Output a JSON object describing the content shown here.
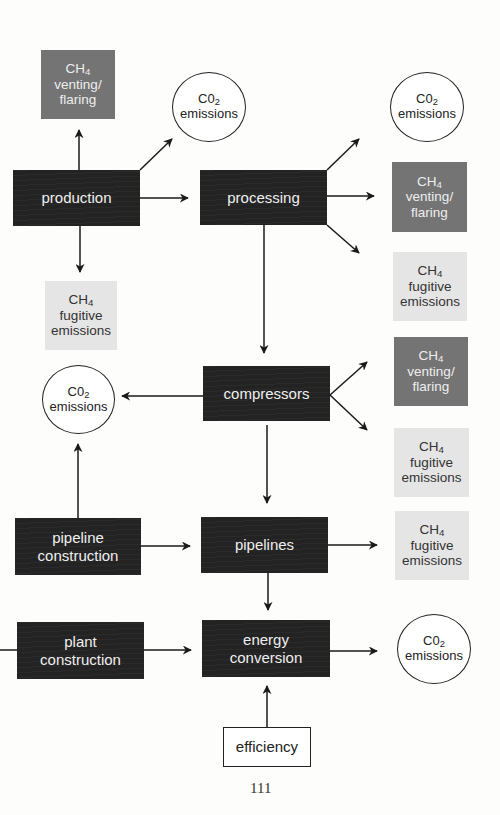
{
  "diagram": {
    "type": "flowchart",
    "page_number": "111",
    "colors": {
      "process_box": "#232323",
      "venting_box": "#747474",
      "fugitive_box": "#e5e5e5",
      "arrow": "#1a1a1a"
    },
    "labels": {
      "ch4": "CH",
      "ch4_sub": "4",
      "co2": "C0",
      "co2_sub": "2",
      "emissions": "emissions",
      "venting": "venting/",
      "flaring": "flaring",
      "fugitive": "fugitive"
    },
    "process_nodes": {
      "production": "production",
      "processing": "processing",
      "compressors": "compressors",
      "pipeline_construction_1": "pipeline",
      "pipeline_construction_2": "construction",
      "pipelines": "pipelines",
      "plant_construction_1": "plant",
      "plant_construction_2": "construction",
      "energy_conversion_1": "energy",
      "energy_conversion_2": "conversion",
      "efficiency": "efficiency"
    },
    "edges": [
      {
        "from": "production",
        "to": "CH4 venting/flaring (top)"
      },
      {
        "from": "production",
        "to": "C02 emissions (top)"
      },
      {
        "from": "production",
        "to": "processing"
      },
      {
        "from": "production",
        "to": "CH4 fugitive emissions (left)"
      },
      {
        "from": "processing",
        "to": "C02 emissions (top right)"
      },
      {
        "from": "processing",
        "to": "CH4 venting/flaring (right)"
      },
      {
        "from": "processing",
        "to": "CH4 fugitive emissions (right)"
      },
      {
        "from": "processing",
        "to": "compressors"
      },
      {
        "from": "compressors",
        "to": "C02 emissions (left)"
      },
      {
        "from": "compressors",
        "to": "CH4 venting/flaring (right mid)"
      },
      {
        "from": "compressors",
        "to": "CH4 fugitive emissions (right mid)"
      },
      {
        "from": "compressors",
        "to": "pipelines"
      },
      {
        "from": "pipeline construction",
        "to": "C02 emissions (left)"
      },
      {
        "from": "pipeline construction",
        "to": "pipelines"
      },
      {
        "from": "pipelines",
        "to": "CH4 fugitive emissions (right lower)"
      },
      {
        "from": "pipelines",
        "to": "energy conversion"
      },
      {
        "from": "plant construction",
        "to": "energy conversion"
      },
      {
        "from": "energy conversion",
        "to": "C02 emissions (bottom right)"
      },
      {
        "from": "efficiency",
        "to": "energy conversion"
      }
    ]
  }
}
